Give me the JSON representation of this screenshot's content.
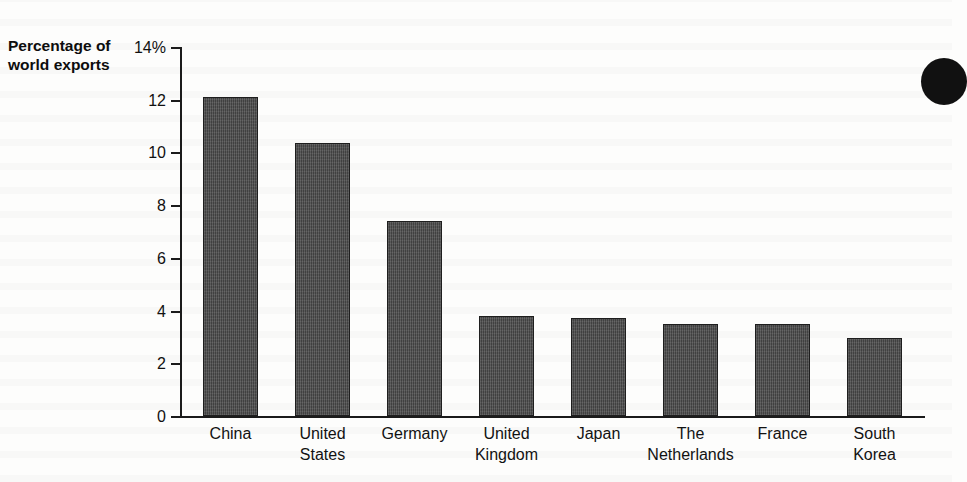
{
  "chart_data": {
    "type": "bar",
    "title": "",
    "xlabel": "",
    "ylabel": "Percentage of world exports",
    "ylabel_lines": [
      "Percentage of",
      "world exports"
    ],
    "categories": [
      "China",
      "United States",
      "Germany",
      "United Kingdom",
      "Japan",
      "The Netherlands",
      "France",
      "South Korea"
    ],
    "category_lines": [
      [
        "China"
      ],
      [
        "United",
        "States"
      ],
      [
        "Germany"
      ],
      [
        "United",
        "Kingdom"
      ],
      [
        "Japan"
      ],
      [
        "The",
        "Netherlands"
      ],
      [
        "France"
      ],
      [
        "South",
        "Korea"
      ]
    ],
    "values": [
      12.1,
      10.35,
      7.4,
      3.8,
      3.7,
      3.5,
      3.5,
      2.95
    ],
    "ylim": [
      0,
      14
    ],
    "ytick_values": [
      0,
      2,
      4,
      6,
      8,
      10,
      12,
      14
    ],
    "ytick_labels": [
      "0",
      "2",
      "4",
      "6",
      "8",
      "10",
      "12",
      "14%"
    ],
    "grid": false,
    "legend": false,
    "bar_color": "#4c4c4c",
    "axis_color": "#1b1b1b",
    "background_color": "#fdfdfc"
  },
  "annotation": {
    "margin_mark_name": "page-margin-ink-blob"
  }
}
